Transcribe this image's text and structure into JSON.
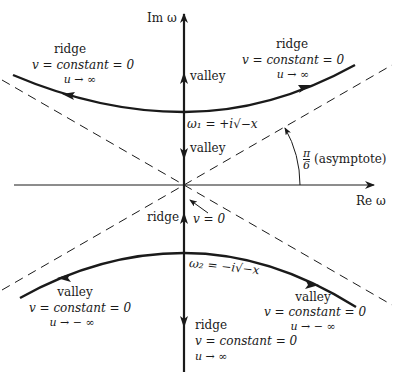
{
  "diagram": {
    "axes": {
      "imag_label": "Im ω",
      "real_label": "Re ω"
    },
    "saddle_points": {
      "upper": "ω₁ = +i√−x",
      "lower": "ω₂ = −i√−x"
    },
    "angle_label": {
      "numerator": "π",
      "denominator": "6",
      "suffix": "(asymptote)"
    },
    "annotations": {
      "upper_left": {
        "type": "ridge",
        "line1": "v = constant = 0",
        "line2": "u → ∞"
      },
      "upper_right": {
        "type": "ridge",
        "line1": "v = constant = 0",
        "line2": "u → ∞"
      },
      "lower_left": {
        "type": "valley",
        "line1": "v = constant = 0",
        "line2": "u → − ∞"
      },
      "lower_right": {
        "type": "valley",
        "line1": "v = constant = 0",
        "line2": "u → − ∞"
      },
      "bottom_axis": {
        "type": "ridge",
        "line1": "v = constant = 0",
        "line2": "u → ∞"
      },
      "axis_valley_upper": "valley",
      "axis_valley_middle": "valley",
      "axis_ridge_origin": "ridge",
      "origin_v": "v = 0"
    },
    "colors": {
      "ink": "#1a1a1a",
      "background": "#ffffff"
    }
  }
}
